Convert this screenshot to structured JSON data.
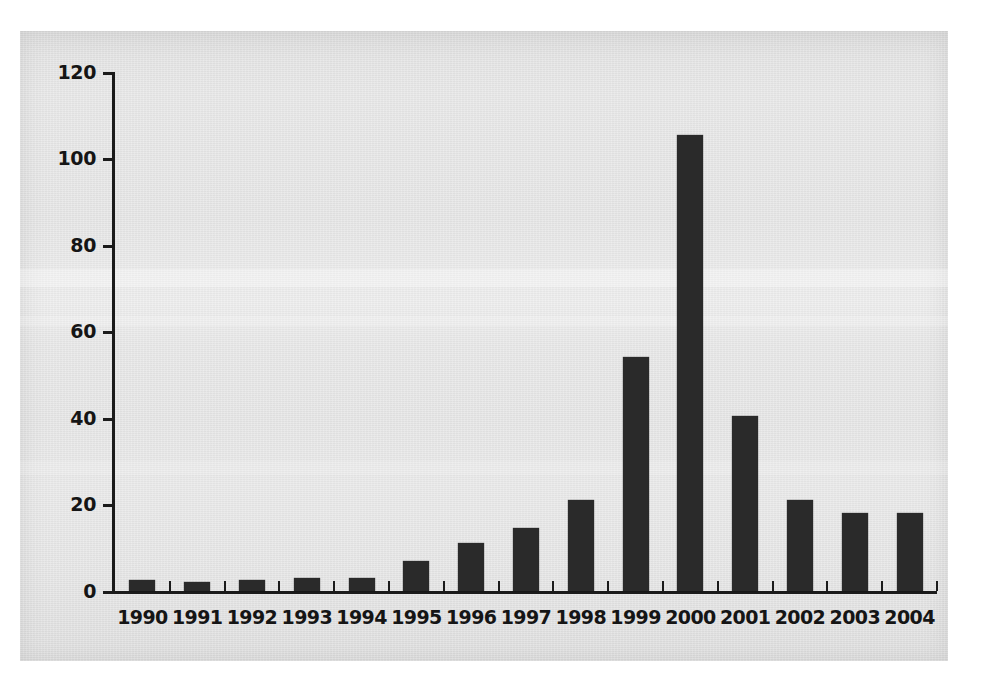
{
  "figure": {
    "background_color": "#e6e6e6",
    "page_color": "#ffffff",
    "bar_color": "#2a2a2a",
    "axis_color": "#1b1b1b"
  },
  "chart_data": {
    "type": "bar",
    "title": "",
    "subtitle": "",
    "xlabel": "",
    "ylabel": "",
    "categories": [
      "1990",
      "1991",
      "1992",
      "1993",
      "1994",
      "1995",
      "1996",
      "1997",
      "1998",
      "1999",
      "2000",
      "2001",
      "2002",
      "2003",
      "2004"
    ],
    "values": [
      2.5,
      2,
      2.5,
      3,
      3,
      7,
      11,
      14.5,
      21,
      54,
      105.5,
      40.5,
      21,
      18,
      18
    ],
    "ylim": [
      0,
      120
    ],
    "yticks": [
      0,
      20,
      40,
      60,
      80,
      100,
      120
    ],
    "ytick_labels": [
      "0",
      "20",
      "40",
      "60",
      "80",
      "100",
      "120"
    ],
    "xtick_labels": [
      "1990",
      "1991",
      "1992",
      "1993",
      "1994",
      "1995",
      "1996",
      "1997",
      "1998",
      "1999",
      "2000",
      "2001",
      "2002",
      "2003",
      "2004"
    ],
    "grid": false,
    "legend": null,
    "legend_position": "none",
    "annotations": []
  }
}
